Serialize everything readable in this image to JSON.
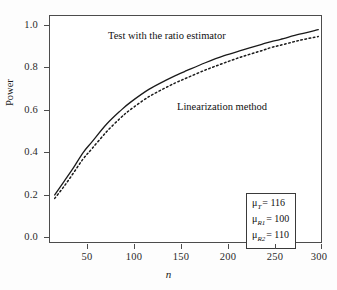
{
  "chart_data": {
    "type": "line",
    "title": "",
    "xlabel": "n",
    "ylabel": "Power",
    "xlim": [
      15,
      305
    ],
    "ylim": [
      0.0,
      1.0
    ],
    "grid": false,
    "legend_position": "inline-annotations",
    "x_ticks": [
      "50",
      "100",
      "150",
      "200",
      "250",
      "300"
    ],
    "x_tick_values": [
      50,
      100,
      150,
      200,
      250,
      300
    ],
    "y_ticks": [
      "0.0",
      "0.2",
      "0.4",
      "0.6",
      "0.8",
      "1.0"
    ],
    "y_tick_values": [
      0.0,
      0.2,
      0.4,
      0.6,
      0.8,
      1.0
    ],
    "x": [
      20,
      30,
      40,
      50,
      60,
      75,
      90,
      100,
      120,
      140,
      150,
      160,
      180,
      200,
      220,
      240,
      250,
      260,
      280,
      300
    ],
    "series": [
      {
        "name": "Test with the ratio estimator",
        "style": "solid",
        "color": "#1a1a1a",
        "values": [
          0.215,
          0.275,
          0.335,
          0.4,
          0.45,
          0.525,
          0.585,
          0.62,
          0.678,
          0.722,
          0.742,
          0.76,
          0.795,
          0.826,
          0.851,
          0.876,
          0.888,
          0.898,
          0.92,
          0.94
        ]
      },
      {
        "name": "Linearization method",
        "style": "dotted",
        "color": "#1a1a1a",
        "values": [
          0.2,
          0.253,
          0.312,
          0.372,
          0.42,
          0.492,
          0.553,
          0.588,
          0.646,
          0.69,
          0.71,
          0.728,
          0.763,
          0.794,
          0.823,
          0.848,
          0.862,
          0.872,
          0.893,
          0.91
        ]
      }
    ],
    "annotations": [
      {
        "text": "Test with the ratio estimator",
        "x": 118,
        "y": 0.955
      },
      {
        "text": "Linearization method",
        "x": 205,
        "y": 0.64
      }
    ]
  },
  "axes": {
    "y_title": "Power",
    "x_title": "n",
    "y_tick_labels": [
      "1.0",
      "0.8",
      "0.6",
      "0.4",
      "0.2",
      "0.0"
    ],
    "x_tick_labels": [
      "50",
      "100",
      "150",
      "200",
      "250",
      "300"
    ]
  },
  "annotations": {
    "solid_curve_label": "Test with the ratio estimator",
    "dashed_curve_label": "Linearization method"
  },
  "param_box": {
    "rows": [
      {
        "symbol": "μ",
        "subscript": "T",
        "equals": "= 116",
        "value": "116"
      },
      {
        "symbol": "μ",
        "subscript": "R1",
        "equals": "= 100",
        "value": "100"
      },
      {
        "symbol": "μ",
        "subscript": "R2",
        "equals": "= 110",
        "value": "110"
      }
    ]
  },
  "colors": {
    "line": "#1a1a1a",
    "frame": "#4c4c4c",
    "text": "#1a1a1a",
    "background": "#fdfdfd",
    "plot_background": "#ffffff"
  }
}
